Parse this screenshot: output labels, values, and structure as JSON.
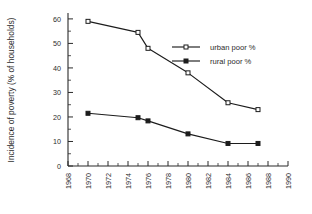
{
  "chart_data": {
    "type": "line",
    "title": "",
    "xlabel": "",
    "ylabel": "Incidence of poverty (% of households)",
    "xlim": [
      1968,
      1990
    ],
    "ylim": [
      0,
      62
    ],
    "grid": false,
    "legend_position": "upper-right-inside",
    "x_ticks": [
      "1968",
      "1970",
      "1972",
      "1974",
      "1976",
      "1978",
      "1980",
      "1982",
      "1984",
      "1986",
      "1988",
      "1990"
    ],
    "x_tick_values": [
      1968,
      1970,
      1972,
      1974,
      1976,
      1978,
      1980,
      1982,
      1984,
      1986,
      1988,
      1990
    ],
    "x_minor_interval": 1,
    "y_ticks": [
      "0",
      "10",
      "20",
      "30",
      "40",
      "50",
      "60"
    ],
    "y_tick_values": [
      0,
      10,
      20,
      30,
      40,
      50,
      60
    ],
    "y_minor_interval": 5,
    "series": [
      {
        "name": "urban poor %",
        "marker": "open-square",
        "x": [
          1970,
          1975,
          1976,
          1980,
          1984,
          1987
        ],
        "values": [
          59.0,
          54.5,
          48.0,
          38.0,
          25.8,
          23.0
        ]
      },
      {
        "name": "rural poor %",
        "marker": "filled-square",
        "x": [
          1970,
          1975,
          1976,
          1980,
          1984,
          1987
        ],
        "values": [
          21.5,
          19.7,
          18.4,
          13.1,
          9.2,
          9.2
        ]
      }
    ]
  },
  "legend": {
    "entries": [
      {
        "label": "urban poor %"
      },
      {
        "label": "rural poor %"
      }
    ]
  },
  "axes": {
    "y_title": "Incidence of poverty (% of households)"
  },
  "colors": {
    "ink": "#1c1c1c",
    "background": "#ffffff"
  }
}
